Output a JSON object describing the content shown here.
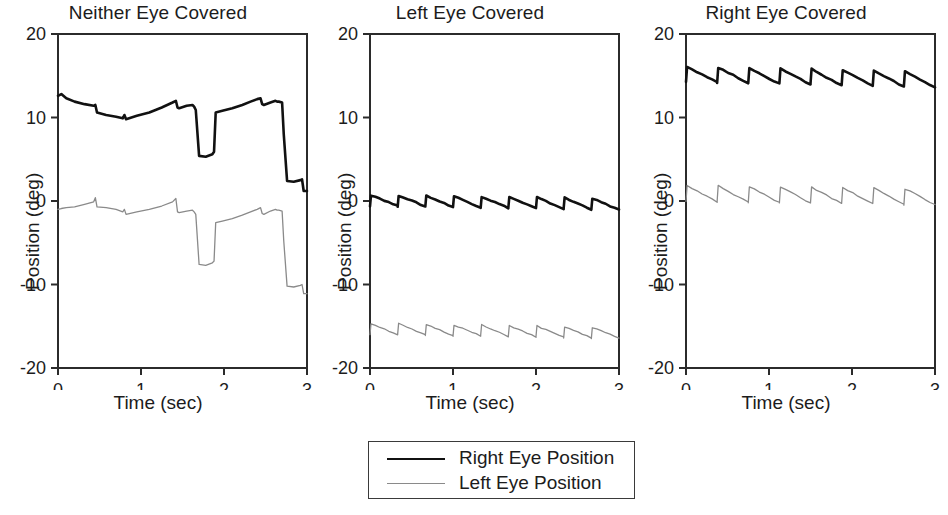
{
  "figure": {
    "panel_count": 3,
    "legend": {
      "items": [
        {
          "label": "Right Eye Position",
          "color": "#111111",
          "width": 2.6
        },
        {
          "label": "Left Eye Position",
          "color": "#8a8a8a",
          "width": 1.3
        }
      ]
    }
  },
  "chart_data": [
    {
      "type": "line",
      "title": "Neither Eye Covered",
      "xlabel": "Time (sec)",
      "ylabel": "Position (deg)",
      "xlim": [
        0,
        3
      ],
      "ylim": [
        -20,
        20
      ],
      "xticks": [
        0,
        1,
        2,
        3
      ],
      "yticks": [
        20,
        10,
        0,
        -10,
        -20
      ],
      "xtick_labels": [
        "0",
        "1",
        "2",
        "3"
      ],
      "ytick_labels": [
        "20",
        "10",
        "0",
        "-10",
        "-20"
      ],
      "grid": false,
      "legend_position": "below-figure",
      "series": [
        {
          "name": "Right Eye Position",
          "color": "#111111",
          "width": 2.6,
          "x": [
            0.0,
            0.04,
            0.1,
            0.2,
            0.32,
            0.43,
            0.45,
            0.47,
            0.58,
            0.7,
            0.78,
            0.8,
            0.82,
            0.95,
            1.1,
            1.25,
            1.38,
            1.42,
            1.44,
            1.46,
            1.55,
            1.62,
            1.64,
            1.66,
            1.7,
            1.78,
            1.86,
            1.88,
            1.9,
            1.98,
            2.1,
            2.22,
            2.32,
            2.4,
            2.44,
            2.46,
            2.48,
            2.56,
            2.62,
            2.64,
            2.66,
            2.7,
            2.72,
            2.76,
            2.84,
            2.92,
            2.94,
            2.96,
            3.0
          ],
          "y": [
            12.6,
            12.8,
            12.3,
            11.9,
            11.6,
            11.4,
            11.5,
            10.6,
            10.3,
            10.1,
            9.9,
            10.3,
            9.8,
            10.2,
            10.6,
            11.2,
            11.8,
            12.0,
            11.2,
            11.1,
            11.4,
            11.5,
            11.3,
            10.9,
            5.4,
            5.3,
            5.6,
            5.9,
            10.6,
            10.8,
            11.1,
            11.5,
            11.9,
            12.2,
            12.3,
            11.6,
            11.5,
            11.8,
            12.0,
            11.9,
            11.9,
            11.8,
            8.0,
            2.4,
            2.3,
            2.5,
            2.6,
            1.2,
            1.2
          ]
        },
        {
          "name": "Left Eye Position",
          "color": "#8a8a8a",
          "width": 1.3,
          "x": [
            0.0,
            0.04,
            0.1,
            0.2,
            0.32,
            0.43,
            0.45,
            0.47,
            0.58,
            0.7,
            0.78,
            0.8,
            0.82,
            0.95,
            1.1,
            1.25,
            1.38,
            1.42,
            1.44,
            1.46,
            1.55,
            1.62,
            1.64,
            1.66,
            1.7,
            1.78,
            1.86,
            1.88,
            1.9,
            1.98,
            2.1,
            2.22,
            2.32,
            2.4,
            2.44,
            2.46,
            2.48,
            2.56,
            2.62,
            2.64,
            2.66,
            2.7,
            2.72,
            2.76,
            2.84,
            2.92,
            2.94,
            2.96,
            3.0
          ],
          "y": [
            -1.0,
            -0.9,
            -0.8,
            -0.7,
            -0.4,
            -0.1,
            0.4,
            -0.7,
            -0.8,
            -1.0,
            -1.3,
            -1.0,
            -1.6,
            -1.3,
            -1.0,
            -0.6,
            -0.1,
            0.3,
            -1.3,
            -1.4,
            -1.2,
            -1.1,
            -1.3,
            -1.6,
            -7.6,
            -7.7,
            -7.4,
            -7.2,
            -2.6,
            -2.4,
            -2.1,
            -1.7,
            -1.3,
            -1.0,
            -0.8,
            -1.5,
            -1.6,
            -1.2,
            -1.0,
            -1.1,
            -1.1,
            -1.2,
            -4.8,
            -10.2,
            -10.3,
            -10.1,
            -10.0,
            -11.1,
            -11.1
          ]
        }
      ]
    },
    {
      "type": "line",
      "title": "Left Eye Covered",
      "xlabel": "Time (sec)",
      "ylabel": "Position (deg)",
      "xlim": [
        0,
        3
      ],
      "ylim": [
        -20,
        20
      ],
      "xticks": [
        0,
        1,
        2,
        3
      ],
      "yticks": [
        20,
        10,
        0,
        -10,
        -20
      ],
      "xtick_labels": [
        "0",
        "1",
        "2",
        "3"
      ],
      "ytick_labels": [
        "20",
        "10",
        "0",
        "-10",
        "-20"
      ],
      "grid": false,
      "legend_position": "below-figure",
      "waveform": {
        "pattern": "jerk-nystagmus-sawtooth",
        "cycles": 9,
        "period_sec": 0.333,
        "slow_phase_deg": -1.2,
        "fast_phase_deg": 1.2
      },
      "series": [
        {
          "name": "Right Eye Position",
          "color": "#111111",
          "width": 2.6,
          "baseline": 0.1,
          "amplitude": 1.3,
          "drift_end": -0.5,
          "cycles": 9,
          "x": [],
          "y": []
        },
        {
          "name": "Left Eye Position",
          "color": "#8a8a8a",
          "width": 1.3,
          "baseline": -15.3,
          "amplitude": 1.3,
          "drift_end": -0.5,
          "cycles": 9,
          "x": [],
          "y": []
        }
      ]
    },
    {
      "type": "line",
      "title": "Right Eye Covered",
      "xlabel": "Time (sec)",
      "ylabel": "Position (deg)",
      "xlim": [
        0,
        3
      ],
      "ylim": [
        -20,
        20
      ],
      "xticks": [
        0,
        1,
        2,
        3
      ],
      "yticks": [
        20,
        10,
        0,
        -10,
        -20
      ],
      "xtick_labels": [
        "0",
        "1",
        "2",
        "3"
      ],
      "ytick_labels": [
        "20",
        "10",
        "0",
        "-10",
        "-20"
      ],
      "grid": false,
      "legend_position": "below-figure",
      "waveform": {
        "pattern": "jerk-nystagmus-sawtooth",
        "cycles": 8,
        "period_sec": 0.375,
        "slow_phase_deg": -1.8,
        "fast_phase_deg": 1.8
      },
      "series": [
        {
          "name": "Right Eye Position",
          "color": "#111111",
          "width": 2.6,
          "baseline": 15.2,
          "amplitude": 1.8,
          "drift_end": -0.7,
          "cycles": 8,
          "x": [],
          "y": []
        },
        {
          "name": "Left Eye Position",
          "color": "#8a8a8a",
          "width": 1.3,
          "baseline": 0.9,
          "amplitude": 1.9,
          "drift_end": -0.4,
          "cycles": 8,
          "x": [],
          "y": []
        }
      ]
    }
  ]
}
